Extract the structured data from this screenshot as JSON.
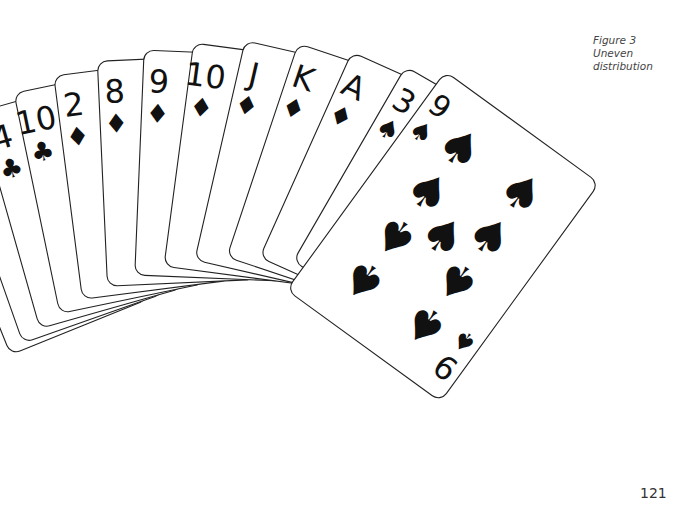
{
  "caption": {
    "line1": "Figure 3",
    "line2": "Uneven distribution"
  },
  "page_number": "121",
  "hand": {
    "title": "Fanned hand of playing cards",
    "cards": [
      {
        "rank": "3",
        "suit": "hearts",
        "symbol": "♥"
      },
      {
        "rank": "J",
        "suit": "hearts",
        "symbol": "♥"
      },
      {
        "rank": "4",
        "suit": "clubs",
        "symbol": "♣"
      },
      {
        "rank": "10",
        "suit": "clubs",
        "symbol": "♣"
      },
      {
        "rank": "2",
        "suit": "diamonds",
        "symbol": "♦"
      },
      {
        "rank": "8",
        "suit": "diamonds",
        "symbol": "♦"
      },
      {
        "rank": "9",
        "suit": "diamonds",
        "symbol": "♦"
      },
      {
        "rank": "10",
        "suit": "diamonds",
        "symbol": "♦"
      },
      {
        "rank": "J",
        "suit": "diamonds",
        "symbol": "♦"
      },
      {
        "rank": "K",
        "suit": "diamonds",
        "symbol": "♦"
      },
      {
        "rank": "A",
        "suit": "diamonds",
        "symbol": "♦"
      },
      {
        "rank": "3",
        "suit": "spades",
        "symbol": "♠"
      },
      {
        "rank": "9",
        "suit": "spades",
        "symbol": "♠"
      }
    ],
    "suit_counts": {
      "hearts": 2,
      "clubs": 2,
      "diamonds": 7,
      "spades": 2
    }
  },
  "colors": {
    "ink": "#111111",
    "card_face": "#ffffff",
    "card_border": "#222222",
    "caption_text": "#444444"
  }
}
